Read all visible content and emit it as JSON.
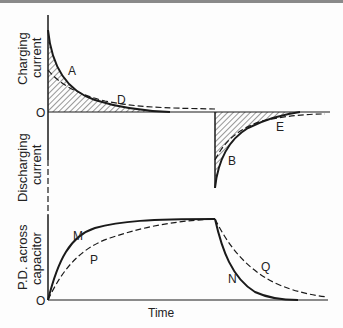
{
  "diagram": {
    "axis_labels": {
      "charging_current": [
        "Charging",
        "current"
      ],
      "discharging_current": [
        "Discharging",
        "current"
      ],
      "pd_across_capacitor": [
        "P.D. across",
        "capacitor"
      ],
      "time": "Time",
      "origin_top": "O",
      "origin_bottom": "O"
    },
    "curve_labels": {
      "A": "A",
      "B": "B",
      "D": "D",
      "E": "E",
      "M": "M",
      "N": "N",
      "P": "P",
      "Q": "Q"
    },
    "legend_semantics": {
      "solid": "smaller time constant (A, B, M, N)",
      "dashed": "larger time constant (D, E, P, Q)",
      "hatched": "area under current curve = charge"
    },
    "colors": {
      "line": "#1a1a1a",
      "background": "#fdfdfd",
      "topbar": "#8a8a8a"
    }
  }
}
